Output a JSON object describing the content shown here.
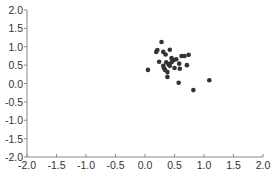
{
  "chart_data": {
    "type": "scatter",
    "title": "",
    "xlabel": "",
    "ylabel": "",
    "xlim": [
      -2.0,
      2.0
    ],
    "ylim": [
      -2.0,
      2.0
    ],
    "grid": false,
    "legend": null,
    "x_ticks": [
      "-2.0",
      "-1.5",
      "-1.0",
      "-0.5",
      "0.0",
      "0.5",
      "1.0",
      "1.5",
      "2.0"
    ],
    "y_ticks": [
      "2.0",
      "1.5",
      "1.0",
      "0.5",
      "0.0",
      "-0.5",
      "-1.0",
      "-1.5",
      "-2.0"
    ],
    "x_tick_values": [
      -2.0,
      -1.5,
      -1.0,
      -0.5,
      0.0,
      0.5,
      1.0,
      1.5,
      2.0
    ],
    "y_tick_values": [
      2.0,
      1.5,
      1.0,
      0.5,
      0.0,
      -0.5,
      -1.0,
      -1.5,
      -2.0
    ],
    "marker_color": "#333333",
    "points": [
      {
        "x": 0.05,
        "y": 0.37
      },
      {
        "x": 0.28,
        "y": 1.13
      },
      {
        "x": 0.19,
        "y": 0.86
      },
      {
        "x": 0.21,
        "y": 0.91
      },
      {
        "x": 0.31,
        "y": 0.86
      },
      {
        "x": 0.35,
        "y": 0.79
      },
      {
        "x": 0.42,
        "y": 0.92
      },
      {
        "x": 0.24,
        "y": 0.59
      },
      {
        "x": 0.36,
        "y": 0.58
      },
      {
        "x": 0.31,
        "y": 0.48
      },
      {
        "x": 0.32,
        "y": 0.42
      },
      {
        "x": 0.34,
        "y": 0.37
      },
      {
        "x": 0.38,
        "y": 0.31
      },
      {
        "x": 0.38,
        "y": 0.18
      },
      {
        "x": 0.4,
        "y": 0.52
      },
      {
        "x": 0.45,
        "y": 0.69
      },
      {
        "x": 0.49,
        "y": 0.64
      },
      {
        "x": 0.53,
        "y": 0.66
      },
      {
        "x": 0.45,
        "y": 0.58
      },
      {
        "x": 0.5,
        "y": 0.42
      },
      {
        "x": 0.58,
        "y": 0.54
      },
      {
        "x": 0.59,
        "y": 0.4
      },
      {
        "x": 0.62,
        "y": 0.75
      },
      {
        "x": 0.67,
        "y": 0.75
      },
      {
        "x": 0.74,
        "y": 0.78
      },
      {
        "x": 0.71,
        "y": 0.5
      },
      {
        "x": 0.57,
        "y": 0.02
      },
      {
        "x": 0.82,
        "y": -0.18
      },
      {
        "x": 1.09,
        "y": 0.09
      },
      {
        "x": 0.42,
        "y": 0.48
      }
    ]
  }
}
